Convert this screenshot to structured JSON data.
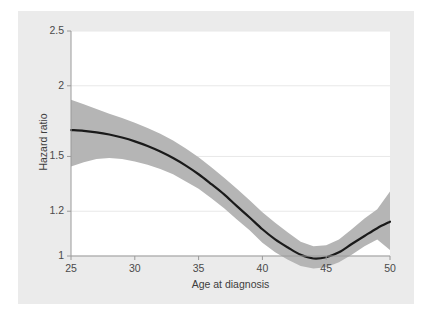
{
  "chart_data": {
    "type": "line",
    "title": "",
    "subtitle": "",
    "xlabel": "Age at diagnosis",
    "ylabel": "Hazard ratio",
    "xlim": [
      25,
      50
    ],
    "ylim": [
      1,
      2.5
    ],
    "yscale": "log",
    "xscale": "linear",
    "grid": true,
    "grid_axis": "y",
    "legend": "none",
    "xticks": [
      25,
      30,
      35,
      40,
      45,
      50
    ],
    "xticklabels": [
      "25",
      "30",
      "35",
      "40",
      "45",
      "50"
    ],
    "yticks": [
      1,
      1.2,
      1.5,
      2,
      2.5
    ],
    "yticklabels": [
      "1",
      "1.2",
      "1.5",
      "2",
      "2.5"
    ],
    "reference_line": 1,
    "colors": {
      "line": "#1a1a1a",
      "band": "#b5b5b5",
      "plot_background": "#ffffff",
      "graph_background": "#ebebeb",
      "page_background": "#ffffff",
      "grid": "#e8e8e8",
      "axis": "#9a9a9a",
      "tick_label": "#4a4a4a"
    },
    "series": [
      {
        "name": "Hazard ratio",
        "kind": "line",
        "x": [
          25,
          26,
          27,
          28,
          29,
          30,
          31,
          32,
          33,
          34,
          35,
          36,
          37,
          38,
          39,
          40,
          41,
          42,
          43,
          44,
          45,
          46,
          47,
          48,
          49,
          50
        ],
        "values": [
          1.67,
          1.665,
          1.655,
          1.64,
          1.62,
          1.595,
          1.565,
          1.53,
          1.49,
          1.445,
          1.395,
          1.34,
          1.285,
          1.225,
          1.17,
          1.115,
          1.07,
          1.035,
          1.005,
          0.99,
          0.995,
          1.015,
          1.05,
          1.085,
          1.12,
          1.15
        ]
      },
      {
        "name": "95% confidence interval",
        "kind": "band",
        "x": [
          25,
          26,
          27,
          28,
          29,
          30,
          31,
          32,
          33,
          34,
          35,
          36,
          37,
          38,
          39,
          40,
          41,
          42,
          43,
          44,
          45,
          46,
          47,
          48,
          49,
          50
        ],
        "lower": [
          1.44,
          1.465,
          1.485,
          1.49,
          1.485,
          1.47,
          1.45,
          1.425,
          1.395,
          1.355,
          1.315,
          1.265,
          1.215,
          1.16,
          1.11,
          1.055,
          1.015,
          0.985,
          0.96,
          0.95,
          0.955,
          0.975,
          1.005,
          1.04,
          1.07,
          1.025
        ],
        "upper": [
          1.89,
          1.855,
          1.82,
          1.785,
          1.755,
          1.72,
          1.685,
          1.645,
          1.6,
          1.55,
          1.495,
          1.435,
          1.375,
          1.315,
          1.255,
          1.195,
          1.145,
          1.1,
          1.06,
          1.04,
          1.045,
          1.07,
          1.115,
          1.165,
          1.21,
          1.3
        ]
      }
    ]
  }
}
